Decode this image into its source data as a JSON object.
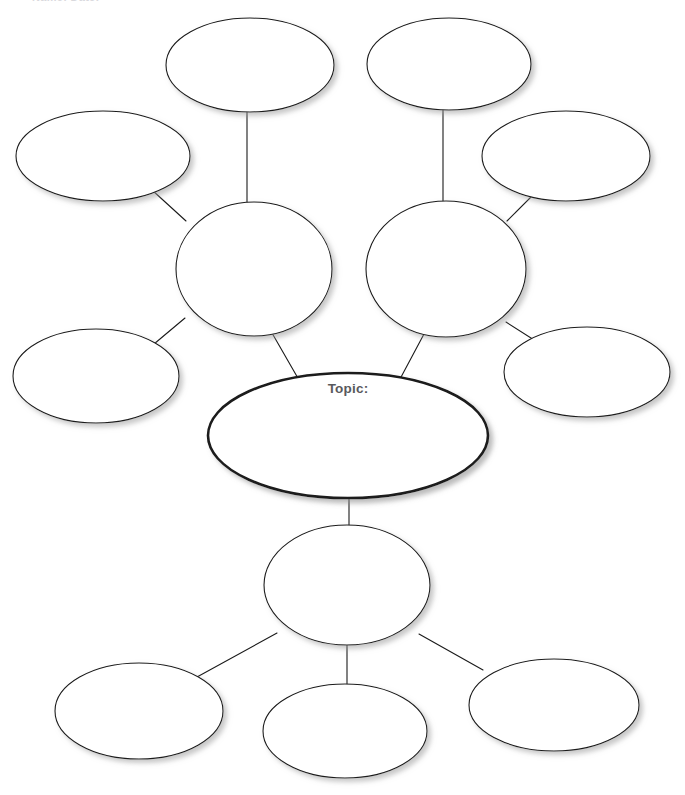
{
  "document": {
    "title": "Concept Map Graphic Organizer",
    "clipped_header_text": "Name:  Date:",
    "background_color": "#ffffff",
    "page_width": 685,
    "page_height": 795
  },
  "style": {
    "node_fill": "#ffffff",
    "node_stroke": "#1a1a1a",
    "node_stroke_width": 1.1,
    "center_stroke_width": 2.6,
    "connector_color": "#1a1a1a",
    "connector_width": 1.1,
    "shadow_color": "#bdbdbd",
    "topic_text_color": "#59595c"
  },
  "center_node": {
    "id": "topic",
    "label": "Topic:",
    "value": "",
    "cx": 348,
    "cy": 435.5,
    "rx": 140,
    "ry": 62.5,
    "emphasis": true
  },
  "hub_nodes": [
    {
      "id": "hub-left",
      "label": "",
      "value": "",
      "cx": 254,
      "cy": 269,
      "rx": 78,
      "ry": 67
    },
    {
      "id": "hub-right",
      "label": "",
      "value": "",
      "cx": 446,
      "cy": 269,
      "rx": 80,
      "ry": 68
    },
    {
      "id": "hub-bottom",
      "label": "",
      "value": "",
      "cx": 347,
      "cy": 585,
      "rx": 83,
      "ry": 60
    }
  ],
  "leaf_nodes": [
    {
      "id": "leaf-top-left",
      "label": "",
      "value": "",
      "cx": 250,
      "cy": 65,
      "rx": 84,
      "ry": 47
    },
    {
      "id": "leaf-far-left",
      "label": "",
      "value": "",
      "cx": 103,
      "cy": 156,
      "rx": 87,
      "ry": 45
    },
    {
      "id": "leaf-lower-left",
      "label": "",
      "value": "",
      "cx": 96,
      "cy": 376,
      "rx": 83,
      "ry": 47
    },
    {
      "id": "leaf-top-right",
      "label": "",
      "value": "",
      "cx": 449,
      "cy": 64,
      "rx": 82,
      "ry": 46
    },
    {
      "id": "leaf-far-right",
      "label": "",
      "value": "",
      "cx": 566,
      "cy": 156,
      "rx": 84,
      "ry": 45
    },
    {
      "id": "leaf-mid-right",
      "label": "",
      "value": "",
      "cx": 587,
      "cy": 372,
      "rx": 83,
      "ry": 45
    },
    {
      "id": "leaf-bottom-left",
      "label": "",
      "value": "",
      "cx": 139,
      "cy": 711,
      "rx": 84,
      "ry": 48
    },
    {
      "id": "leaf-bottom-mid",
      "label": "",
      "value": "",
      "cx": 345,
      "cy": 731,
      "rx": 82,
      "ry": 47
    },
    {
      "id": "leaf-bottom-right",
      "label": "",
      "value": "",
      "cx": 554,
      "cy": 705,
      "rx": 85,
      "ry": 46
    }
  ],
  "connectors": [
    {
      "id": "conn-topic-hubleft",
      "from": "topic",
      "to": "hub-left",
      "x1": 299,
      "y1": 380,
      "x2": 272,
      "y2": 333
    },
    {
      "id": "conn-topic-hubright",
      "from": "topic",
      "to": "hub-right",
      "x1": 400,
      "y1": 379,
      "x2": 424,
      "y2": 334
    },
    {
      "id": "conn-topic-hubbottom",
      "from": "topic",
      "to": "hub-bottom",
      "x1": 349,
      "y1": 496,
      "x2": 349,
      "y2": 527
    },
    {
      "id": "conn-hubleft-topleft",
      "from": "hub-left",
      "to": "leaf-top-left",
      "x1": 247,
      "y1": 203,
      "x2": 247,
      "y2": 110
    },
    {
      "id": "conn-hubleft-farleft",
      "from": "hub-left",
      "to": "leaf-far-left",
      "x1": 186,
      "y1": 221,
      "x2": 152,
      "y2": 190
    },
    {
      "id": "conn-hubleft-lowerleft",
      "from": "hub-left",
      "to": "leaf-lower-left",
      "x1": 185,
      "y1": 318,
      "x2": 154,
      "y2": 344
    },
    {
      "id": "conn-hubright-topright",
      "from": "hub-right",
      "to": "leaf-top-right",
      "x1": 443,
      "y1": 202,
      "x2": 443,
      "y2": 109
    },
    {
      "id": "conn-hubright-farright",
      "from": "hub-right",
      "to": "leaf-far-right",
      "x1": 507,
      "y1": 221,
      "x2": 538,
      "y2": 190
    },
    {
      "id": "conn-hubright-midright",
      "from": "hub-right",
      "to": "leaf-mid-right",
      "x1": 506,
      "y1": 322,
      "x2": 542,
      "y2": 345
    },
    {
      "id": "conn-hubbot-botleft",
      "from": "hub-bottom",
      "to": "leaf-bottom-left",
      "x1": 277,
      "y1": 633,
      "x2": 197,
      "y2": 677
    },
    {
      "id": "conn-hubbot-botmid",
      "from": "hub-bottom",
      "to": "leaf-bottom-mid",
      "x1": 347,
      "y1": 645,
      "x2": 347,
      "y2": 686
    },
    {
      "id": "conn-hubbot-botright",
      "from": "hub-bottom",
      "to": "leaf-bottom-right",
      "x1": 419,
      "y1": 634,
      "x2": 483,
      "y2": 670
    }
  ]
}
